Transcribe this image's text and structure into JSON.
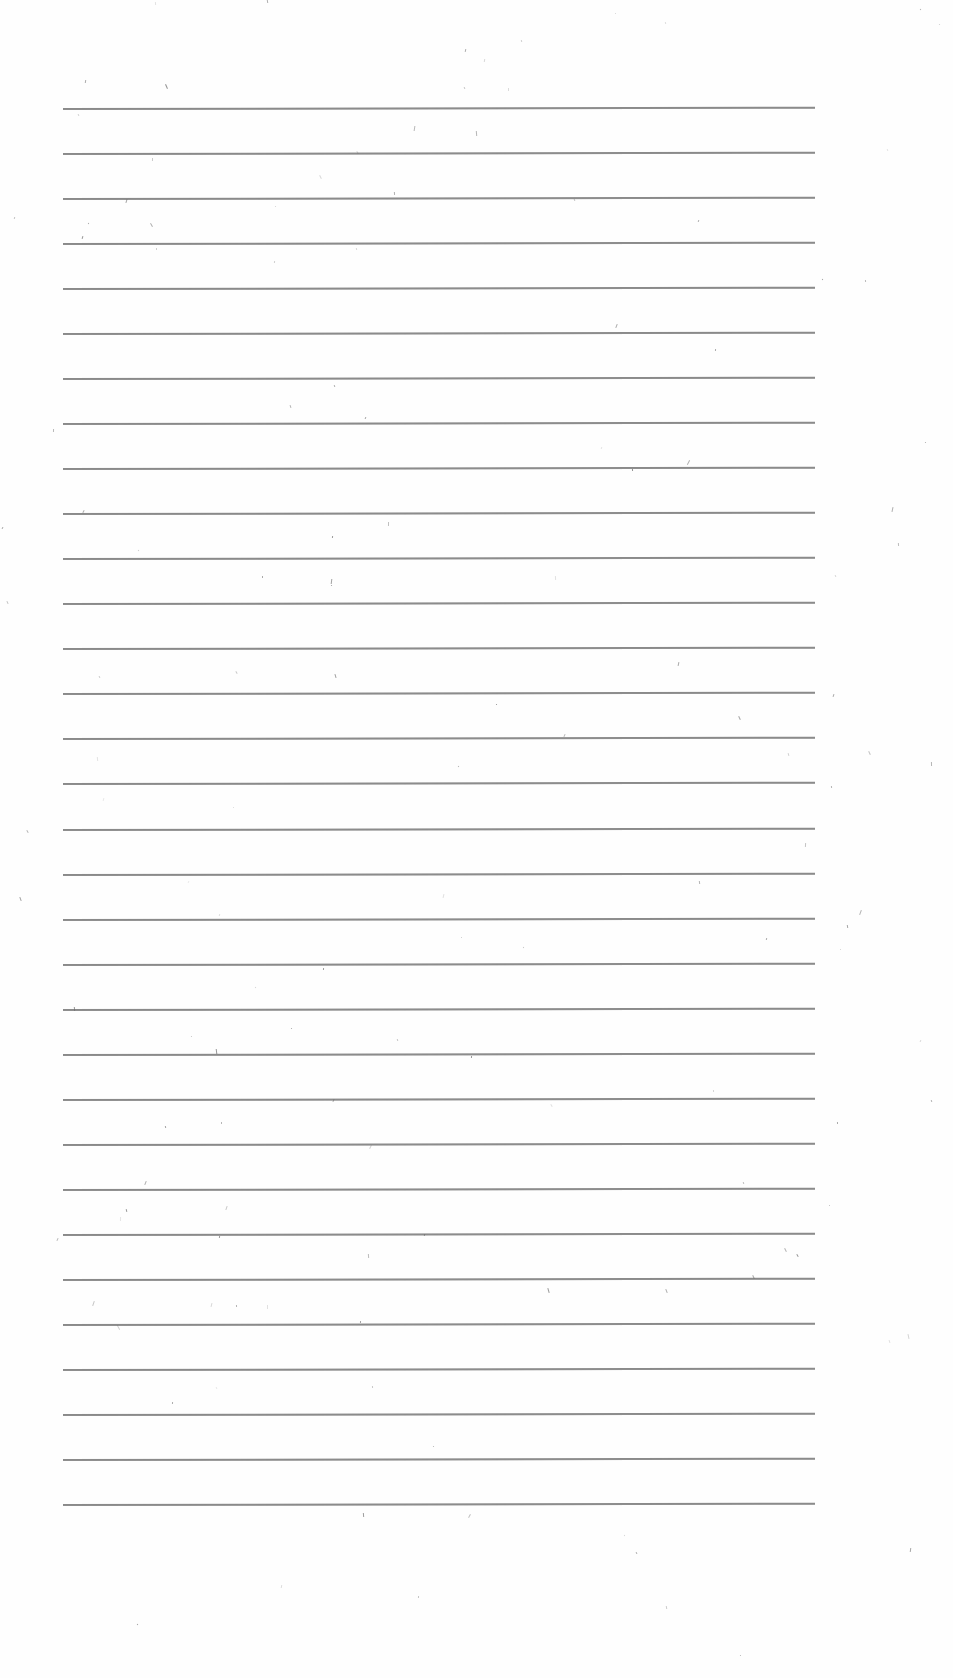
{
  "page": {
    "type": "blank lined paper (scan)",
    "background_color": "#fefefe",
    "rule_color": "#8a8a8a",
    "rules": {
      "count": 32,
      "first_y": 108,
      "last_y": 1504,
      "left_x": 63,
      "right_x": 815
    },
    "text_content": []
  }
}
